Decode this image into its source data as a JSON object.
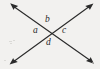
{
  "figure": {
    "background_color": "#f2f1ef",
    "stroke_color": "#2b2b2b",
    "width": 100,
    "height": 69
  },
  "diagram_data": {
    "type": "geometry-line-diagram",
    "description": "Two straight double-headed arrow lines crossing at a single interior point, creating four labeled angles arranged around the intersection.",
    "intersection_point": {
      "x": 54,
      "y": 32
    },
    "lines": [
      {
        "name": "line-nw-se",
        "from": {
          "x": 11,
          "y": 4
        },
        "to": {
          "x": 93,
          "y": 63
        },
        "arrowheads": "both"
      },
      {
        "name": "line-ne-sw",
        "from": {
          "x": 93,
          "y": 4
        },
        "to": {
          "x": 10,
          "y": 64
        },
        "arrowheads": "both"
      }
    ],
    "angle_labels": [
      {
        "id": "a",
        "text": "a",
        "position": "left",
        "x": 36,
        "y": 31
      },
      {
        "id": "b",
        "text": "b",
        "position": "top",
        "x": 48,
        "y": 20
      },
      {
        "id": "c",
        "text": "c",
        "position": "right",
        "x": 65,
        "y": 31
      },
      {
        "id": "d",
        "text": "d",
        "position": "bottom",
        "x": 49,
        "y": 43
      }
    ]
  },
  "labels": {
    "a": "a",
    "b": "b",
    "c": "c",
    "d": "d"
  }
}
